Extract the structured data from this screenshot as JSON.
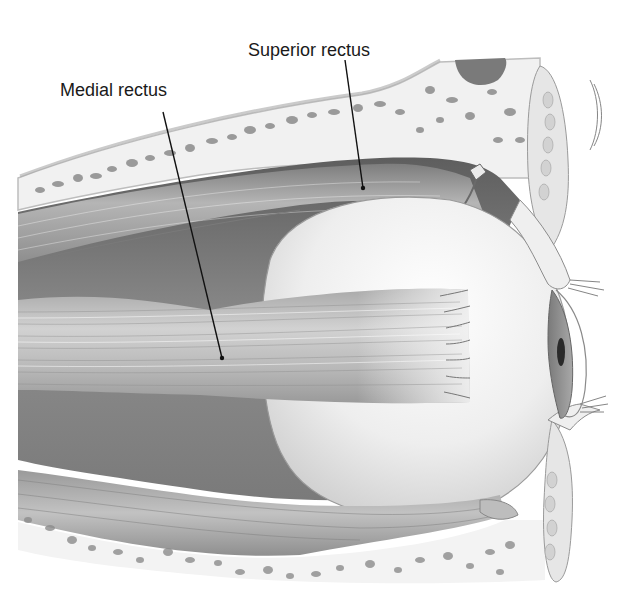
{
  "figure": {
    "labels": {
      "medial_rectus": "Medial rectus",
      "superior_rectus": "Superior rectus"
    },
    "leaders": {
      "medial_rectus": {
        "x1": 163,
        "y1": 112,
        "x2": 222,
        "y2": 358
      },
      "superior_rectus": {
        "x1": 345,
        "y1": 60,
        "x2": 363,
        "y2": 188
      }
    },
    "colors": {
      "background": "#ffffff",
      "bone": "#f1f1f1",
      "bone_pore": "#8c8c8c",
      "muscle_dark": "#6e6e6e",
      "muscle_mid": "#a3a3a3",
      "muscle_light": "#cfcfcf",
      "eyeball": "#f4f4f4",
      "iris": "#8a8a8a",
      "pupil": "#2a2a2a",
      "leader": "#111111",
      "text": "#1a1a1a"
    }
  }
}
